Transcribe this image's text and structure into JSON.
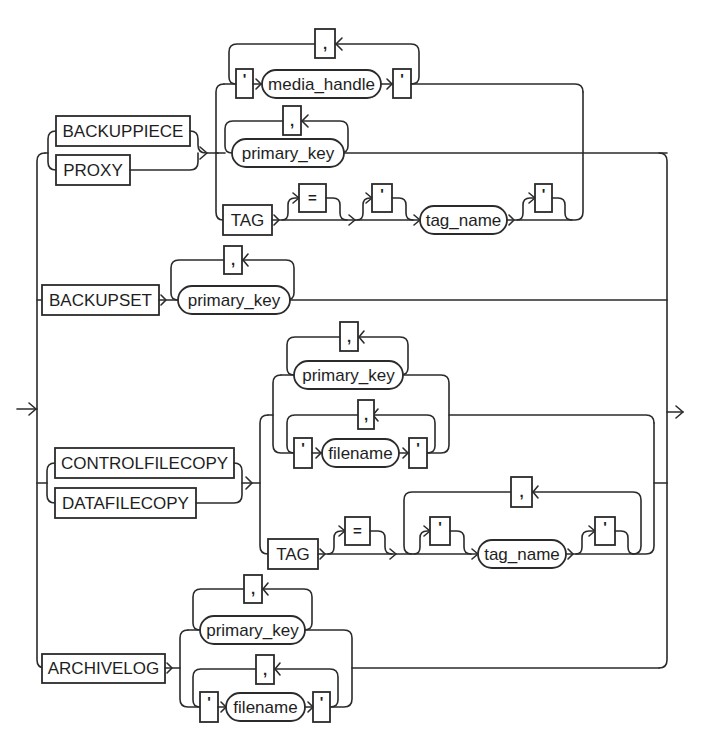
{
  "diagram": {
    "type": "railroad-syntax-diagram",
    "entry_arrow": "→",
    "exit_arrow": "→",
    "branches": [
      {
        "name": "backuppiece-proxy",
        "keywords": [
          "BACKUPPIECE",
          "PROXY"
        ],
        "options": [
          {
            "sequence": [
              "'",
              "media_handle",
              "'"
            ],
            "repeat_separator": ","
          },
          {
            "sequence": [
              "primary_key"
            ],
            "repeat_separator": ","
          },
          {
            "sequence": [
              "TAG",
              "=",
              "'",
              "tag_name",
              "'"
            ],
            "optional": [
              "=",
              "'",
              "'"
            ]
          }
        ]
      },
      {
        "name": "backupset",
        "keywords": [
          "BACKUPSET"
        ],
        "options": [
          {
            "sequence": [
              "primary_key"
            ],
            "repeat_separator": ","
          }
        ]
      },
      {
        "name": "controlfilecopy-datafilecopy",
        "keywords": [
          "CONTROLFILECOPY",
          "DATAFILECOPY"
        ],
        "options": [
          {
            "sequence": [
              "primary_key"
            ],
            "repeat_separator": ","
          },
          {
            "sequence": [
              "'",
              "filename",
              "'"
            ],
            "repeat_separator": ","
          },
          {
            "sequence": [
              "TAG",
              "=",
              "'",
              "tag_name",
              "'"
            ],
            "optional": [
              "=",
              "'",
              "'"
            ],
            "repeat_separator": ","
          }
        ]
      },
      {
        "name": "archivelog",
        "keywords": [
          "ARCHIVELOG"
        ],
        "options": [
          {
            "sequence": [
              "primary_key"
            ],
            "repeat_separator": ","
          },
          {
            "sequence": [
              "'",
              "filename",
              "'"
            ],
            "repeat_separator": ","
          }
        ]
      }
    ]
  },
  "labels": {
    "backuppiece": "BACKUPPIECE",
    "proxy": "PROXY",
    "backupset": "BACKUPSET",
    "controlfilecopy": "CONTROLFILECOPY",
    "datafilecopy": "DATAFILECOPY",
    "archivelog": "ARCHIVELOG",
    "tag": "TAG",
    "media_handle": "media_handle",
    "primary_key": "primary_key",
    "filename": "filename",
    "tag_name": "tag_name",
    "quote": "'",
    "comma": ",",
    "equals": "="
  }
}
